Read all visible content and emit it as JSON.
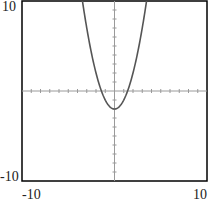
{
  "chart_data": {
    "type": "line",
    "title": "",
    "xlabel": "",
    "ylabel": "",
    "function": "y = x^2 - 2",
    "xlim": [
      -10,
      10
    ],
    "ylim": [
      -10,
      10
    ],
    "grid": false,
    "axes_through_origin": true,
    "tick_step": 1,
    "tick_labels": {
      "x_min": "-10",
      "x_max": "10",
      "y_min": "-10",
      "y_max": "10"
    },
    "series": [
      {
        "name": "y = x^2 - 2",
        "x": [
          -3.46,
          -3,
          -2,
          -1.41,
          -1,
          0,
          1,
          1.41,
          2,
          3,
          3.46
        ],
        "y": [
          10,
          7,
          2,
          0,
          -1,
          -2,
          -1,
          0,
          2,
          7,
          10
        ]
      }
    ],
    "colors": {
      "curve": "#555555",
      "axes": "#999999",
      "frame": "#000000"
    }
  }
}
